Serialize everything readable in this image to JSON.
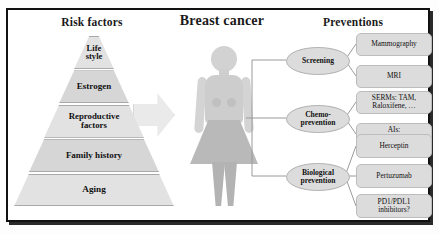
{
  "headers": {
    "risk": "Risk factors",
    "title": "Breast cancer",
    "preventions": "Preventions"
  },
  "pyramid": {
    "tiers": [
      {
        "label": "Life\nstyle"
      },
      {
        "label": "Estrogen"
      },
      {
        "label": "Reproductive\nfactors"
      },
      {
        "label": "Family history"
      },
      {
        "label": "Aging"
      }
    ]
  },
  "prevention_tree": {
    "branches": [
      {
        "name": "Screening",
        "items": [
          "Mammography",
          "MRI"
        ]
      },
      {
        "name": "Chemo-\nprevention",
        "items": [
          "SERMs: TAM,\nRaloxifene, …",
          "AIs:\nExemestane, …"
        ]
      },
      {
        "name": "Biological\nprevention",
        "items": [
          "Herceptin",
          "Pertuzumab",
          "PD1/PDL1\ninhibitors?"
        ]
      }
    ]
  },
  "colors": {
    "panel_fill": "#dcdcdc",
    "figure_fill": "#cdcdcd",
    "arrow_fill": "#eaeaea",
    "border": "#111111"
  }
}
